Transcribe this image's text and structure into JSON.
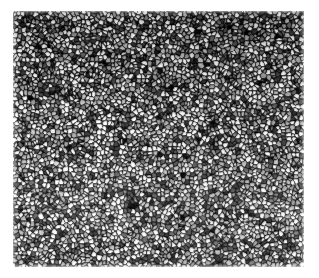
{
  "figure": {
    "kind": "grayscale-micrograph",
    "caption": "",
    "page_background": "#ffffff",
    "plate": {
      "left": 13,
      "top": 11,
      "width": 291,
      "height": 256,
      "base_gray": "#b9b9b9",
      "boundary_color": "#1d1d1d",
      "grain_light": "#e9e9e9",
      "grain_mid": "#a8a8a8",
      "grain_dark": "#4a4a4a"
    },
    "texture": {
      "type": "equiaxed-grain-network",
      "grain_size_px": 4.2,
      "grain_size_range_px": [
        2,
        9
      ],
      "boundary_thickness_px": 1.3,
      "seed": 20240517,
      "cell_count": 5200,
      "noise_amount": 0.3,
      "contrast": 1.22,
      "brightness": 0.02,
      "tonal_bands": [
        {
          "region": "top",
          "relative_density": 1.18,
          "note": "darker, denser boundary network"
        },
        {
          "region": "upper-middle",
          "relative_density": 1.08,
          "note": "dark"
        },
        {
          "region": "center",
          "relative_density": 1.0,
          "note": "neutral reference tone"
        },
        {
          "region": "lower-left",
          "relative_density": 0.86,
          "note": "lighter, coarser visible grains"
        },
        {
          "region": "bottom",
          "relative_density": 0.93,
          "note": "slightly lighter than center"
        }
      ]
    },
    "margins": {
      "left": 13,
      "top": 11,
      "right": 15,
      "bottom": 11
    },
    "annotations": {
      "scale_bar": null,
      "labels": [],
      "arrows": [],
      "text_overlays": []
    }
  },
  "image": {
    "width": 319,
    "height": 278
  }
}
